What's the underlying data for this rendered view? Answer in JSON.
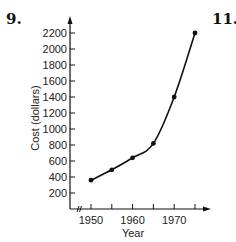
{
  "labels": {
    "problem_left": "9.",
    "problem_right": "11."
  },
  "chart_data": {
    "type": "line",
    "title": "",
    "xlabel": "Year",
    "ylabel": "Cost (dollars)",
    "x": [
      1950,
      1955,
      1960,
      1965,
      1970,
      1975
    ],
    "series": [
      {
        "name": "Cost",
        "values": [
          360,
          490,
          640,
          820,
          1400,
          2200
        ]
      }
    ],
    "x_ticks": [
      1950,
      1955,
      1960,
      1965,
      1970,
      1975
    ],
    "x_tick_labels": [
      "1950",
      "1960",
      "1970"
    ],
    "y_ticks": [
      200,
      400,
      600,
      800,
      1000,
      1200,
      1400,
      1600,
      1800,
      2000,
      2200
    ],
    "y_tick_labels": [
      "200",
      "400",
      "600",
      "800",
      "1000",
      "1200",
      "1400",
      "1600",
      "1800",
      "2000",
      "2200"
    ],
    "xlim": [
      1945,
      1978
    ],
    "ylim": [
      0,
      2400
    ],
    "x_axis_break": true,
    "grid": false,
    "legend": "none",
    "line_color": "#111111",
    "marker": "dot"
  }
}
